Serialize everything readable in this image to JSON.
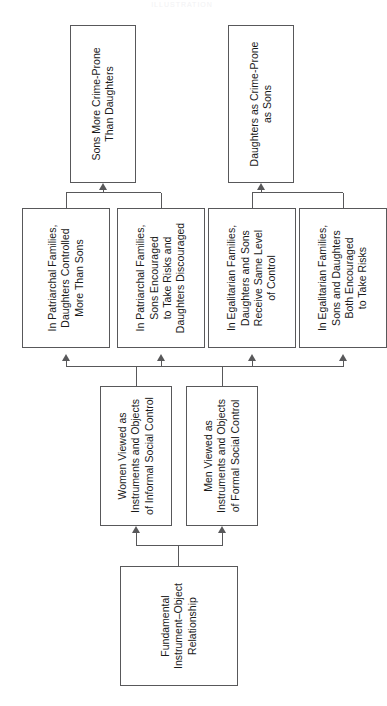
{
  "watermark": "ILLUSTRATION",
  "diagram": {
    "orientation": "rotated-90-ccw",
    "levels": [
      {
        "level": 4,
        "name": "root",
        "nodes": [
          {
            "id": "fundamental",
            "label": "Fundamental\nInstrument–Object\nRelationship"
          }
        ]
      },
      {
        "level": 3,
        "name": "gendered-social-control",
        "nodes": [
          {
            "id": "women-informal",
            "label": "Women Viewed as\nInstruments and Objects\nof Informal Social Control"
          },
          {
            "id": "men-formal",
            "label": "Men Viewed as\nInstruments and Objects\nof Formal Social Control"
          }
        ]
      },
      {
        "level": 2,
        "name": "family-type-propositions",
        "nodes": [
          {
            "id": "patriarchal-control",
            "label": "In Patriarchal Families,\nDaughters Controlled\nMore Than Sons"
          },
          {
            "id": "patriarchal-risk",
            "label": "In Patriarchal Families,\nSons Encouraged\nto Take Risks and\nDaughters Discouraged"
          },
          {
            "id": "egalitarian-control",
            "label": "In Egalitarian Families,\nDaughters and Sons\nReceive Same Level\nof Control"
          },
          {
            "id": "egalitarian-risk",
            "label": "In Egalitarian Families,\nSons and Daughters\nBoth Encouraged\nto Take Risks"
          }
        ]
      },
      {
        "level": 1,
        "name": "outcomes",
        "nodes": [
          {
            "id": "sons-crime-prone",
            "label": "Sons More Crime-Prone\nThan Daughters"
          },
          {
            "id": "daughters-crime",
            "label": "Daughters as Crime-Prone\nas Sons"
          }
        ]
      }
    ],
    "edges": [
      {
        "from": "fundamental",
        "to": "women-informal"
      },
      {
        "from": "fundamental",
        "to": "men-formal"
      },
      {
        "from": "women-informal",
        "to": "patriarchal-control"
      },
      {
        "from": "women-informal",
        "to": "patriarchal-risk"
      },
      {
        "from": "women-informal",
        "to": "egalitarian-control"
      },
      {
        "from": "women-informal",
        "to": "egalitarian-risk"
      },
      {
        "from": "men-formal",
        "to": "patriarchal-control"
      },
      {
        "from": "men-formal",
        "to": "patriarchal-risk"
      },
      {
        "from": "men-formal",
        "to": "egalitarian-control"
      },
      {
        "from": "men-formal",
        "to": "egalitarian-risk"
      },
      {
        "from": "patriarchal-control",
        "to": "sons-crime-prone"
      },
      {
        "from": "patriarchal-risk",
        "to": "sons-crime-prone"
      },
      {
        "from": "egalitarian-control",
        "to": "daughters-crime"
      },
      {
        "from": "egalitarian-risk",
        "to": "daughters-crime"
      }
    ],
    "colors": {
      "box_border": "#58585a",
      "line": "#58585a",
      "background": "#ffffff",
      "text": "#1a1a1a"
    }
  }
}
